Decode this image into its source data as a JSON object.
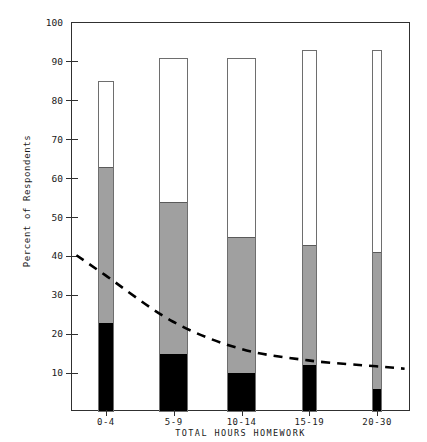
{
  "chart_data": {
    "type": "bar",
    "title": "",
    "xlabel": "TOTAL HOURS HOMEWORK",
    "ylabel": "Percent of Respondents",
    "ylim": [
      0,
      100
    ],
    "yticks": [
      0,
      10,
      20,
      30,
      40,
      50,
      60,
      70,
      80,
      90,
      100
    ],
    "ytick_labels": [
      "",
      "10",
      "20",
      "30",
      "40",
      "50",
      "60",
      "70",
      "80",
      "90",
      "100"
    ],
    "grid": false,
    "legend": "none",
    "stacked": true,
    "categories": [
      "0-4",
      "5-9",
      "10-14",
      "15-19",
      "20-30"
    ],
    "series": [
      {
        "name": "black-segment",
        "color": "#000000",
        "values": [
          23,
          15,
          10,
          12,
          6
        ]
      },
      {
        "name": "gray-segment",
        "color": "#a0a0a0",
        "values": [
          40,
          39,
          35,
          31,
          35
        ]
      },
      {
        "name": "white-segment",
        "color": "#ffffff",
        "values": [
          22,
          37,
          46,
          50,
          52
        ]
      }
    ],
    "cumulative_tops": {
      "black": [
        23,
        15,
        10,
        12,
        6
      ],
      "gray": [
        63,
        54,
        45,
        43,
        41
      ],
      "total": [
        85,
        91,
        91,
        93,
        93
      ]
    },
    "bar_widths_pct": [
      4.5,
      8.5,
      8.5,
      4.5,
      3.0
    ],
    "overlay_line": {
      "name": "trend-line",
      "style": "dashed",
      "color": "#000000",
      "x": [
        "0-4",
        "5-9",
        "10-14",
        "15-19",
        "20-30"
      ],
      "y": [
        35,
        23,
        16,
        13,
        11.5
      ]
    }
  },
  "axis": {
    "y_title": "Percent of Respondents",
    "x_title": "TOTAL HOURS HOMEWORK"
  }
}
